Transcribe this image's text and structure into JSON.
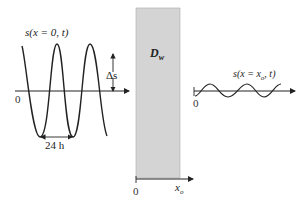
{
  "diagram": {
    "left_signal_label": "s(x = 0, t)",
    "amplitude_label": "Δs",
    "period_label": "24 h",
    "left_origin_label": "0",
    "wall_label": "D",
    "wall_label_sub": "w",
    "right_signal_label": "s(x = x",
    "right_signal_label_sub": "o",
    "right_signal_label_end": ", t)",
    "right_origin_label": "0",
    "depth_axis_origin_label": "0",
    "depth_axis_end_label": "x",
    "depth_axis_end_label_sub": "o",
    "colors": {
      "wall_fill": "#d4d4d4",
      "line": "#222222"
    }
  }
}
